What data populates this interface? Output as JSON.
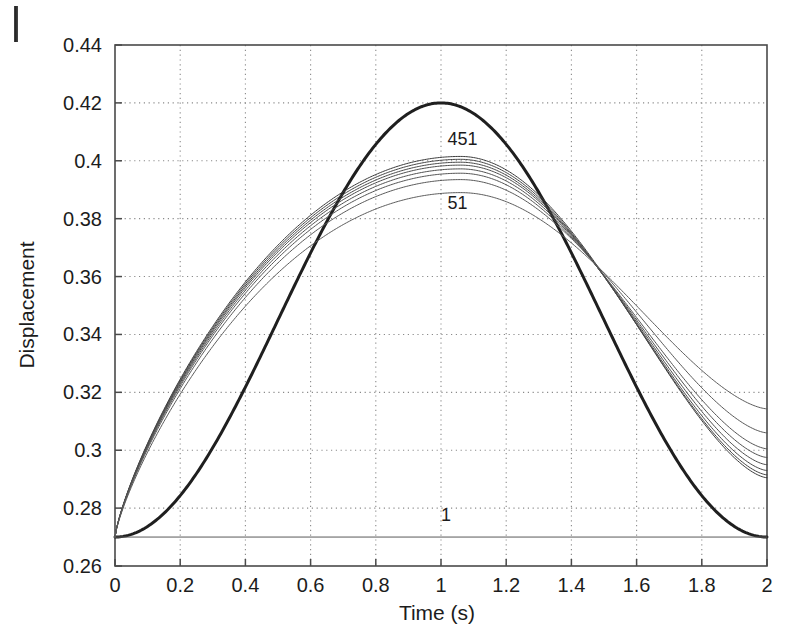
{
  "figure": {
    "background_color": "#ffffff",
    "axis_color": "#4a4a4a",
    "grid_color": "#8a8a8a",
    "curve_color": "#555555",
    "highlight_curve_color": "#1f1f1f"
  },
  "chart_data": {
    "type": "line",
    "title": "",
    "xlabel": "Time (s)",
    "ylabel": "Displacement",
    "xlim": [
      0,
      2
    ],
    "ylim": [
      0.26,
      0.44
    ],
    "xticks": [
      0,
      0.2,
      0.4,
      0.6,
      0.8,
      1,
      1.2,
      1.4,
      1.6,
      1.8,
      2
    ],
    "xtick_labels": [
      "0",
      "0.2",
      "0.4",
      "0.6",
      "0.8",
      "1",
      "1.2",
      "1.4",
      "1.6",
      "1.8",
      "2"
    ],
    "yticks": [
      0.26,
      0.28,
      0.3,
      0.32,
      0.34,
      0.36,
      0.38,
      0.4,
      0.42,
      0.44
    ],
    "ytick_labels": [
      "0.26",
      "0.28",
      "0.3",
      "0.32",
      "0.34",
      "0.36",
      "0.38",
      "0.4",
      "0.42",
      "0.44"
    ],
    "grid": true,
    "grid_style": "dotted",
    "legend": "none",
    "annotations": [
      {
        "text": "451",
        "x": 1.02,
        "y": 0.4055,
        "target_curve": "n451"
      },
      {
        "text": "51",
        "x": 1.02,
        "y": 0.3835,
        "target_curve": "n51"
      },
      {
        "text": "1",
        "x": 1.0,
        "y": 0.2755,
        "target_curve": "n1"
      }
    ],
    "series": [
      {
        "name": "exact",
        "label": "",
        "style": "thick",
        "width": 3.0,
        "color": "#1f1f1f",
        "description": "Smooth reference solution, raised-cosine from 0.27 to peak 0.42 at t=1 and back to 0.27 at t=2",
        "x": [
          0,
          0.05,
          0.1,
          0.15,
          0.2,
          0.25,
          0.3,
          0.35,
          0.4,
          0.45,
          0.5,
          0.55,
          0.6,
          0.65,
          0.7,
          0.75,
          0.8,
          0.85,
          0.9,
          0.95,
          1,
          1.05,
          1.1,
          1.15,
          1.2,
          1.25,
          1.3,
          1.35,
          1.4,
          1.45,
          1.5,
          1.55,
          1.6,
          1.65,
          1.7,
          1.75,
          1.8,
          1.85,
          1.9,
          1.95,
          2
        ],
        "y": [
          0.27,
          0.2701,
          0.2704,
          0.2708,
          0.2715,
          0.2726,
          0.274,
          0.2759,
          0.2782,
          0.2812,
          0.2848,
          0.289,
          0.2938,
          0.2992,
          0.3051,
          0.3115,
          0.3182,
          0.3252,
          0.3324,
          0.3396,
          0.3468,
          0.3539,
          0.3608,
          0.3673,
          0.3735,
          0.3792,
          0.3844,
          0.389,
          0.3929,
          0.3962,
          0.3987,
          0.4005,
          0.4016,
          0.402,
          0.4016,
          0.4005,
          0.3987,
          0.3962,
          0.3929,
          0.389,
          0.3844
        ]
      },
      {
        "name": "n451",
        "label": "451",
        "style": "thin",
        "width": 1.0,
        "color": "#3c3c3c",
        "peak_value": 0.4015,
        "end_value": 0.2905,
        "description": "Highest-resolution approximation (451 elements), peak just above 0.40"
      },
      {
        "name": "n351",
        "label": "",
        "style": "thin",
        "width": 1.0,
        "color": "#444444",
        "peak_value": 0.4005,
        "end_value": 0.2915
      },
      {
        "name": "n301",
        "label": "",
        "style": "thin",
        "width": 1.0,
        "color": "#484848",
        "peak_value": 0.3995,
        "end_value": 0.293
      },
      {
        "name": "n251",
        "label": "",
        "style": "thin",
        "width": 1.0,
        "color": "#4c4c4c",
        "peak_value": 0.3985,
        "end_value": 0.295
      },
      {
        "name": "n201",
        "label": "",
        "style": "thin",
        "width": 1.0,
        "color": "#505050",
        "peak_value": 0.3972,
        "end_value": 0.2975
      },
      {
        "name": "n151",
        "label": "",
        "style": "thin",
        "width": 1.0,
        "color": "#545454",
        "peak_value": 0.3957,
        "end_value": 0.3005
      },
      {
        "name": "n101",
        "label": "",
        "style": "thin",
        "width": 1.0,
        "color": "#585858",
        "peak_value": 0.3935,
        "end_value": 0.306
      },
      {
        "name": "n51",
        "label": "51",
        "style": "thin",
        "width": 1.0,
        "color": "#5c5c5c",
        "peak_value": 0.389,
        "end_value": 0.3143,
        "description": "Coarsest non-trivial approximation (51 elements), lowest peak"
      },
      {
        "name": "n1",
        "label": "1",
        "style": "flat",
        "width": 1.0,
        "color": "#5a5a5a",
        "constant_value": 0.27,
        "description": "Single element solution, flat line at the initial displacement 0.27"
      }
    ],
    "common_points": {
      "start": {
        "x": 0,
        "y": 0.27
      },
      "crossing_left": {
        "x": 0.56,
        "y": 0.361
      },
      "crossing_right": {
        "x": 1.45,
        "y": 0.3555
      }
    }
  }
}
